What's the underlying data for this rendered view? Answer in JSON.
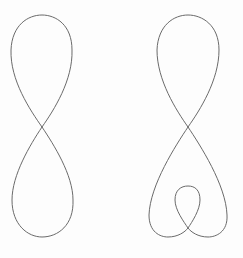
{
  "figures": [
    {
      "name": "figure-eight-curve",
      "stroke": "#6a6a6a",
      "description": "Closed figure-eight curve with a single self-crossing"
    },
    {
      "name": "figure-eight-with-inner-loop-curve",
      "stroke": "#6a6a6a",
      "description": "Closed figure-eight variant whose lower lobe contains a small inner loop"
    }
  ],
  "background": "#fdfdfd"
}
